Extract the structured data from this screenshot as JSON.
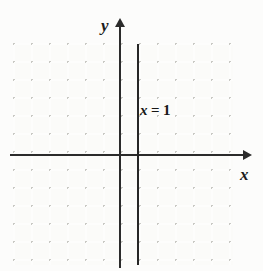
{
  "figure": {
    "background_color": "#fcfcfb",
    "grid_color": "#c9c9c4",
    "axis_color": "#2b2b2b",
    "line_color": "#262626"
  },
  "axes": {
    "x_label": "x",
    "y_label": "y",
    "x_arrow": "arrow-right-icon",
    "y_arrow": "arrow-up-icon"
  },
  "annotation": {
    "equation": "x = 1",
    "variable": "x",
    "relation": "=",
    "value": "1"
  },
  "chart_data": {
    "type": "line",
    "title": "",
    "xlabel": "x",
    "ylabel": "y",
    "grid": true,
    "legend": null,
    "xlim": [
      -6,
      6
    ],
    "ylim": [
      -6,
      6
    ],
    "gridline_step": 1,
    "minor_grid": "dotted",
    "series": [
      {
        "name": "x = 1",
        "equation": "x = 1",
        "orientation": "vertical",
        "x": [
          1,
          1
        ],
        "y": [
          -6,
          6
        ]
      }
    ],
    "annotations": [
      {
        "text": "x = 1",
        "x": 1.2,
        "y": 2.9
      }
    ]
  }
}
